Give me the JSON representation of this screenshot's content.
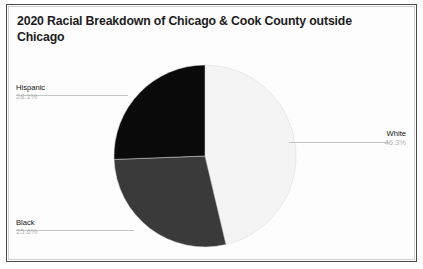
{
  "chart_data": {
    "type": "pie",
    "title": "2020 Racial Breakdown of Chicago & Cook County outside Chicago",
    "xlabel": "",
    "ylabel": "",
    "legend_position": "none",
    "grid": false,
    "categories": [
      "White",
      "Hispanic",
      "Black"
    ],
    "values": [
      46.3,
      28.1,
      25.6
    ],
    "value_labels": [
      "46.3%",
      "28.1%",
      "25.6%"
    ],
    "slice_colors": [
      "#f4f4f4",
      "#3a3a3a",
      "#0a0a0a"
    ],
    "start_angle_deg": 0,
    "direction": "clockwise",
    "slices": [
      {
        "label": "White",
        "value": 46.3,
        "value_label": "46.3%",
        "color": "#f4f4f4"
      },
      {
        "label": "Hispanic",
        "value": 28.1,
        "value_label": "28.1%",
        "color": "#3a3a3a"
      },
      {
        "label": "Black",
        "value": 25.6,
        "value_label": "25.6%",
        "color": "#0a0a0a"
      }
    ]
  },
  "callouts": {
    "hispanic": {
      "name": "Hispanic",
      "value": "28.1%"
    },
    "black": {
      "name": "Black",
      "value": "25.6%"
    },
    "white": {
      "name": "White",
      "value": "46.3%"
    }
  }
}
